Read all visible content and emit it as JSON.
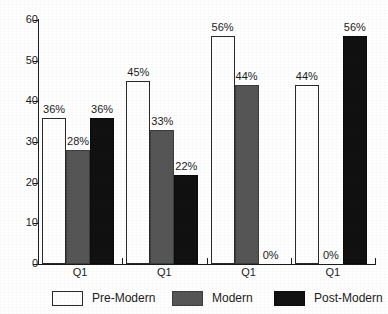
{
  "chart_data": {
    "type": "bar",
    "title": "",
    "subtitle": "",
    "xlabel": "",
    "ylabel": "",
    "ylim": [
      0,
      60
    ],
    "yticks": [
      0,
      10,
      20,
      30,
      40,
      50,
      60
    ],
    "grid": false,
    "legend_position": "bottom",
    "categories": [
      "Q1",
      "Q1",
      "Q1",
      "Q1"
    ],
    "series": [
      {
        "name": "Pre-Modern",
        "color": "#ffffff",
        "values": [
          36,
          45,
          56,
          44
        ],
        "labels": [
          "36%",
          "45%",
          "56%",
          "44%"
        ]
      },
      {
        "name": "Modern",
        "color": "#565656",
        "values": [
          28,
          33,
          44,
          0
        ],
        "labels": [
          "28%",
          "33%",
          "44%",
          "0%"
        ]
      },
      {
        "name": "Post-Modern",
        "color": "#111111",
        "values": [
          36,
          22,
          0,
          56
        ],
        "labels": [
          "36%",
          "22%",
          "0%",
          "56%"
        ]
      }
    ]
  },
  "axis": {
    "y_tick_labels": [
      "60",
      "50",
      "40",
      "30",
      "20",
      "10",
      "0"
    ],
    "x_group_labels": [
      "Q1",
      "Q1",
      "Q1",
      "Q1"
    ]
  },
  "legend": {
    "items": [
      {
        "label": "Pre-Modern",
        "swatch": "pre-modern"
      },
      {
        "label": "Modern",
        "swatch": "modern"
      },
      {
        "label": "Post-Modern",
        "swatch": "post-modern"
      }
    ]
  },
  "colors": {
    "pre_modern": "#ffffff",
    "modern": "#565656",
    "post_modern": "#111111",
    "axis": "#1c1c1c",
    "background": "#ffffff"
  }
}
